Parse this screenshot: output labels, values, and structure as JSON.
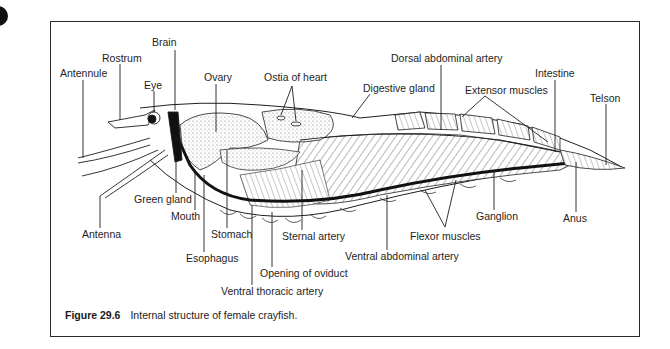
{
  "figure": {
    "number": "Figure 29.6",
    "caption": "Internal structure of female crayfish."
  },
  "labels": {
    "brain": "Brain",
    "rostrum": "Rostrum",
    "antennule": "Antennule",
    "eye": "Eye",
    "ovary": "Ovary",
    "ostia_of_heart": "Ostia of heart",
    "digestive_gland": "Digestive gland",
    "dorsal_abdominal_artery": "Dorsal abdominal artery",
    "extensor_muscles": "Extensor muscles",
    "intestine": "Intestine",
    "telson": "Telson",
    "green_gland": "Green gland",
    "mouth": "Mouth",
    "antenna": "Antenna",
    "stomach": "Stomach",
    "sternal_artery": "Sternal artery",
    "esophagus": "Esophagus",
    "opening_of_oviduct": "Opening of oviduct",
    "ventral_thoracic_artery": "Ventral thoracic artery",
    "ventral_abdominal_artery": "Ventral abdominal artery",
    "flexor_muscles": "Flexor muscles",
    "ganglion": "Ganglion",
    "anus": "Anus"
  },
  "colors": {
    "ink": "#1e1e1e",
    "stipple": "#d8d8d8",
    "background": "#ffffff"
  }
}
